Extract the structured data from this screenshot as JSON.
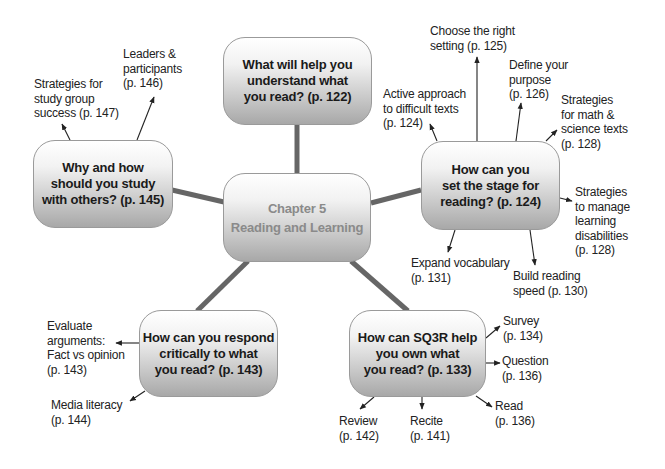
{
  "center": {
    "title": "Chapter 5\nReading and Learning"
  },
  "topics": {
    "top": {
      "label": "What will help you\nunderstand what\nyou read? (p. 122)"
    },
    "left": {
      "label": "Why and how\nshould you study\nwith others? (p. 145)",
      "subtopics": [
        {
          "label": "Strategies for\nstudy group\nsuccess (p. 147)"
        },
        {
          "label": "Leaders &\nparticipants\n(p. 146)"
        }
      ]
    },
    "right": {
      "label": "How can you\nset the stage for\nreading? (p. 124)",
      "subtopics": [
        {
          "label": "Active approach\nto difficult texts\n(p. 124)"
        },
        {
          "label": "Choose the right\nsetting (p. 125)"
        },
        {
          "label": "Define your\npurpose\n(p. 126)"
        },
        {
          "label": "Strategies\nfor math &\nscience texts\n(p. 128)"
        },
        {
          "label": "Strategies\nto manage\nlearning\ndisabilities\n(p. 128)"
        },
        {
          "label": "Build reading\nspeed (p. 130)"
        },
        {
          "label": "Expand vocabulary\n(p. 131)"
        }
      ]
    },
    "bottom_left": {
      "label": "How can you respond\ncritically to what\nyou read? (p. 143)",
      "subtopics": [
        {
          "label": "Evaluate\narguments:\nFact vs opinion\n(p. 143)"
        },
        {
          "label": "Media literacy\n(p. 144)"
        }
      ]
    },
    "bottom_right": {
      "label": "How can SQ3R help\nyou own what\nyou read? (p. 133)",
      "subtopics": [
        {
          "label": "Survey\n(p. 134)"
        },
        {
          "label": "Question\n(p. 136)"
        },
        {
          "label": "Read\n(p. 136)"
        },
        {
          "label": "Recite\n(p. 141)"
        },
        {
          "label": "Review\n(p. 142)"
        }
      ]
    }
  },
  "colors": {
    "connector": "#666666",
    "arrow": "#222222",
    "box_border": "#9a9a9a",
    "center_text": "#8a8a8a",
    "topic_text": "#1a1a1a"
  }
}
